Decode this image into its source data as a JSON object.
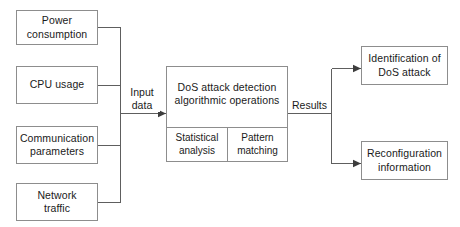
{
  "diagram": {
    "colors": {
      "box_border": "#8d8d8d",
      "wire": "#5e5e5e",
      "text": "#1a1a1a",
      "background": "#ffffff"
    },
    "inputs": [
      {
        "id": "power-consumption",
        "line1": "Power",
        "line2": "consumption"
      },
      {
        "id": "cpu-usage",
        "line1": "CPU usage",
        "line2": ""
      },
      {
        "id": "communication-parameters",
        "line1": "Communication",
        "line2": "parameters"
      },
      {
        "id": "network-traffic",
        "line1": "Network",
        "line2": "traffic"
      }
    ],
    "input_edge_label": {
      "line1": "Input",
      "line2": "data"
    },
    "processor": {
      "line1": "DoS attack detection",
      "line2": "algorithmic operations",
      "subprocesses": [
        {
          "id": "statistical-analysis",
          "line1": "Statistical",
          "line2": "analysis"
        },
        {
          "id": "pattern-matching",
          "line1": "Pattern",
          "line2": "matching"
        }
      ]
    },
    "output_edge_label": "Results",
    "outputs": [
      {
        "id": "identification-of-dos-attack",
        "line1": "Identification of",
        "line2": "DoS attack"
      },
      {
        "id": "reconfiguration-information",
        "line1": "Reconfiguration",
        "line2": "information"
      }
    ]
  }
}
